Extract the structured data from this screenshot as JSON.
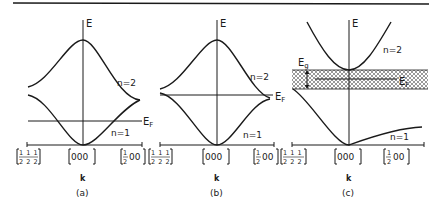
{
  "figure": {
    "axis_label_E": "E",
    "axis_label_k": "k",
    "fermi_label": "E",
    "fermi_sub": "F",
    "gap_label": "E",
    "gap_sub": "g",
    "band_upper": "n=2",
    "band_lower": "n=1",
    "kpoints": {
      "left_num": "1 1 1",
      "left_den": "2 2 2",
      "center": "000",
      "right_num": "1",
      "right_den": "2",
      "right_rest": "00"
    },
    "panels": [
      {
        "caption": "(a)"
      },
      {
        "caption": "(b)"
      },
      {
        "caption": "(c)"
      }
    ]
  },
  "colors": {
    "ink": "#1a1a1a",
    "hatch": "#555555"
  }
}
